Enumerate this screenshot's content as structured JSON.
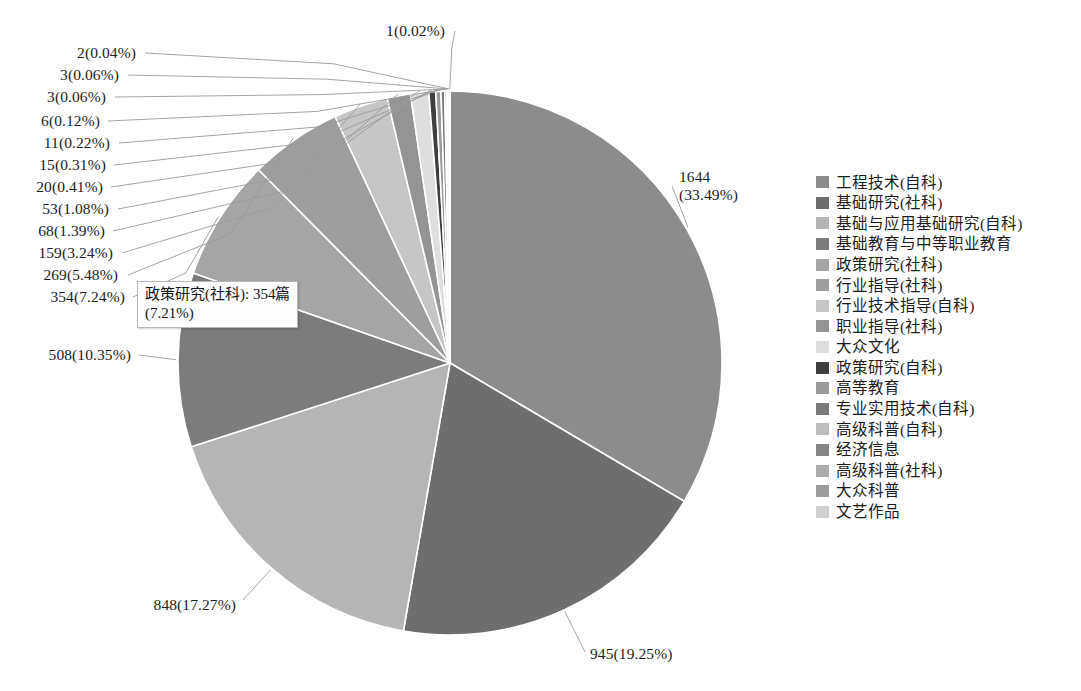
{
  "chart_data": {
    "type": "pie",
    "title": "",
    "subtitle": "",
    "xlabel": "",
    "ylabel": "",
    "legend_position": "right",
    "grid": false,
    "total": 4909,
    "unit": "篇",
    "categories": [
      "工程技术(自科)",
      "基础研究(社科)",
      "基础与应用基础研究(自科)",
      "基础教育与中等职业教育",
      "政策研究(社科)",
      "行业指导(社科)",
      "行业技术指导(自科)",
      "职业指导(社科)",
      "大众文化",
      "政策研究(自科)",
      "高等教育",
      "专业实用技术(自科)",
      "高级科普(自科)",
      "经济信息",
      "高级科普(社科)",
      "大众科普",
      "文艺作品"
    ],
    "values": [
      1644,
      945,
      848,
      508,
      354,
      269,
      159,
      68,
      53,
      20,
      15,
      11,
      6,
      3,
      3,
      2,
      1
    ],
    "percents": [
      33.49,
      19.25,
      17.27,
      10.35,
      7.24,
      5.48,
      3.24,
      1.39,
      1.08,
      0.41,
      0.31,
      0.22,
      0.12,
      0.06,
      0.06,
      0.04,
      0.02
    ],
    "colors": [
      "#8c8c8c",
      "#6e6e6e",
      "#b5b5b5",
      "#7c7c7c",
      "#a5a5a5",
      "#9e9e9e",
      "#c6c6c6",
      "#949494",
      "#dedede",
      "#3f3f3f",
      "#9a9a9a",
      "#7a7a7a",
      "#bdbdbd",
      "#858585",
      "#adadad",
      "#9c9c9c",
      "#cfcfcf"
    ],
    "slice_labels": [
      "1644\n(33.49%)",
      "945(19.25%)",
      "848(17.27%)",
      "508(10.35%)",
      "354(7.24%)",
      "269(5.48%)",
      "159(3.24%)",
      "68(1.39%)",
      "53(1.08%)",
      "20(0.41%)",
      "15(0.31%)",
      "11(0.22%)",
      "6(0.12%)",
      "3(0.06%)",
      "3(0.06%)",
      "2(0.04%)",
      "1(0.02%)"
    ]
  },
  "labels": {
    "l0_line1": "1644",
    "l0_line2": "(33.49%)",
    "l1": "945(19.25%)",
    "l2": "848(17.27%)",
    "l3": "508(10.35%)",
    "l4": "354(7.24%)",
    "l5": "269(5.48%)",
    "l6": "159(3.24%)",
    "l7": "68(1.39%)",
    "l8": "53(1.08%)",
    "l9": "20(0.41%)",
    "l10": "15(0.31%)",
    "l11": "11(0.22%)",
    "l12": "6(0.12%)",
    "l13": "3(0.06%)",
    "l14": "3(0.06%)",
    "l15": "2(0.04%)",
    "l16": "1(0.02%)"
  },
  "tooltip": {
    "line1": "政策研究(社科): 354篇",
    "line2": "(7.21%)"
  },
  "legend": {
    "items": [
      {
        "label": "工程技术(自科)",
        "color": "#8c8c8c"
      },
      {
        "label": "基础研究(社科)",
        "color": "#6e6e6e"
      },
      {
        "label": "基础与应用基础研究(自科)",
        "color": "#b5b5b5"
      },
      {
        "label": "基础教育与中等职业教育",
        "color": "#7c7c7c"
      },
      {
        "label": "政策研究(社科)",
        "color": "#a5a5a5"
      },
      {
        "label": "行业指导(社科)",
        "color": "#9e9e9e"
      },
      {
        "label": "行业技术指导(自科)",
        "color": "#c6c6c6"
      },
      {
        "label": "职业指导(社科)",
        "color": "#949494"
      },
      {
        "label": "大众文化",
        "color": "#dedede"
      },
      {
        "label": "政策研究(自科)",
        "color": "#3f3f3f"
      },
      {
        "label": "高等教育",
        "color": "#9a9a9a"
      },
      {
        "label": "专业实用技术(自科)",
        "color": "#7a7a7a"
      },
      {
        "label": "高级科普(自科)",
        "color": "#bdbdbd"
      },
      {
        "label": "经济信息",
        "color": "#858585"
      },
      {
        "label": "高级科普(社科)",
        "color": "#adadad"
      },
      {
        "label": "大众科普",
        "color": "#9c9c9c"
      },
      {
        "label": "文艺作品",
        "color": "#cfcfcf"
      }
    ]
  }
}
